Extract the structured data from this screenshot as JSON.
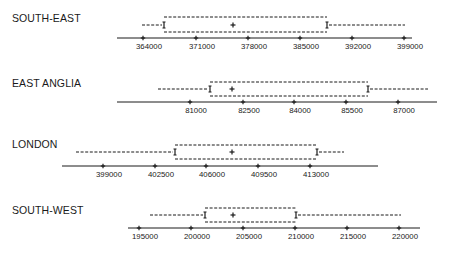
{
  "diagram": {
    "type": "interval-box-plot",
    "panels": [
      {
        "title": "SOUTH-EAST",
        "axis": {
          "x_start": 117,
          "x_end": 412,
          "y": 38
        },
        "ticks": [
          {
            "label": "364000",
            "x": 143
          },
          {
            "label": "371000",
            "x": 196
          },
          {
            "label": "378000",
            "x": 248
          },
          {
            "label": "385000",
            "x": 300
          },
          {
            "label": "392000",
            "x": 352
          },
          {
            "label": "399000",
            "x": 404
          }
        ],
        "box": {
          "x1": 164,
          "x2": 327,
          "y_top": 17,
          "y_bottom": 32,
          "mid_y": 25,
          "center_x": 233
        },
        "whisker_left": {
          "x1": 142,
          "x2": 164
        },
        "whisker_right": {
          "x1": 327,
          "x2": 405
        },
        "title_y": 12
      },
      {
        "title": "EAST ANGLIA",
        "axis": {
          "x_start": 117,
          "x_end": 437,
          "y": 102
        },
        "ticks": [
          {
            "label": "81000",
            "x": 190
          },
          {
            "label": "82500",
            "x": 243
          },
          {
            "label": "84000",
            "x": 294
          },
          {
            "label": "85500",
            "x": 346
          },
          {
            "label": "87000",
            "x": 398
          }
        ],
        "box": {
          "x1": 210,
          "x2": 368,
          "y_top": 82,
          "y_bottom": 96,
          "mid_y": 89,
          "center_x": 232
        },
        "whisker_left": {
          "x1": 158,
          "x2": 210
        },
        "whisker_right": {
          "x1": 368,
          "x2": 428
        },
        "title_y": 77
      },
      {
        "title": "LONDON",
        "axis": {
          "x_start": 62,
          "x_end": 378,
          "y": 166
        },
        "ticks": [
          {
            "label": "399000",
            "x": 103
          },
          {
            "label": "402500",
            "x": 155
          },
          {
            "label": "406000",
            "x": 206
          },
          {
            "label": "409500",
            "x": 258
          },
          {
            "label": "413000",
            "x": 310
          }
        ],
        "box": {
          "x1": 175,
          "x2": 317,
          "y_top": 145,
          "y_bottom": 159,
          "mid_y": 152,
          "center_x": 232
        },
        "whisker_left": {
          "x1": 76,
          "x2": 175
        },
        "whisker_right": {
          "x1": 317,
          "x2": 344
        },
        "title_y": 138
      },
      {
        "title": "SOUTH-WEST",
        "axis": {
          "x_start": 128,
          "x_end": 420,
          "y": 228
        },
        "ticks": [
          {
            "label": "195000",
            "x": 139
          },
          {
            "label": "200000",
            "x": 191
          },
          {
            "label": "205000",
            "x": 243
          },
          {
            "label": "210000",
            "x": 295
          },
          {
            "label": "215000",
            "x": 347
          },
          {
            "label": "220000",
            "x": 399
          }
        ],
        "box": {
          "x1": 205,
          "x2": 296,
          "y_top": 208,
          "y_bottom": 222,
          "mid_y": 215,
          "center_x": 233
        },
        "whisker_left": {
          "x1": 150,
          "x2": 205
        },
        "whisker_right": {
          "x1": 296,
          "x2": 401
        },
        "title_y": 204
      }
    ]
  },
  "style": {
    "ink": "#1a1a1a",
    "background": "#ffffff"
  }
}
